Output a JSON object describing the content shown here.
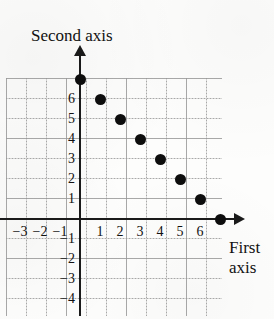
{
  "chart_data": {
    "type": "scatter",
    "title": "",
    "xlabel": "First axis",
    "ylabel": "Second axis",
    "xlim": [
      -3.7,
      7.8
    ],
    "ylim": [
      -4.9,
      7.0
    ],
    "grid": true,
    "legend": false,
    "x_ticks": [
      -3,
      -2,
      -1,
      1,
      2,
      3,
      4,
      5,
      6
    ],
    "y_ticks": [
      6,
      5,
      4,
      3,
      2,
      1,
      -1,
      -2,
      -3,
      -4
    ],
    "x_tick_labels": [
      "−3",
      "−2",
      "−1",
      "1",
      "2",
      "3",
      "4",
      "5",
      "6"
    ],
    "y_tick_labels": [
      "6",
      "5",
      "4",
      "3",
      "2",
      "1",
      "−1",
      "−2",
      "−3",
      "−4"
    ],
    "series": [
      {
        "name": "points",
        "marker": "filled-circle",
        "color": "#0d0d0d",
        "points": [
          {
            "x": 0,
            "y": 7
          },
          {
            "x": 1,
            "y": 6
          },
          {
            "x": 2,
            "y": 5
          },
          {
            "x": 3,
            "y": 4
          },
          {
            "x": 4,
            "y": 3
          },
          {
            "x": 5,
            "y": 2
          },
          {
            "x": 6,
            "y": 1
          },
          {
            "x": 7,
            "y": 0
          }
        ]
      }
    ]
  },
  "axes": {
    "vertical_title": "Second axis",
    "horizontal_title": "First axis"
  },
  "colors": {
    "ink": "#1a1a1a",
    "marker": "#0d0d0d",
    "grid": "#787878",
    "paper": "#fdfdfc"
  }
}
